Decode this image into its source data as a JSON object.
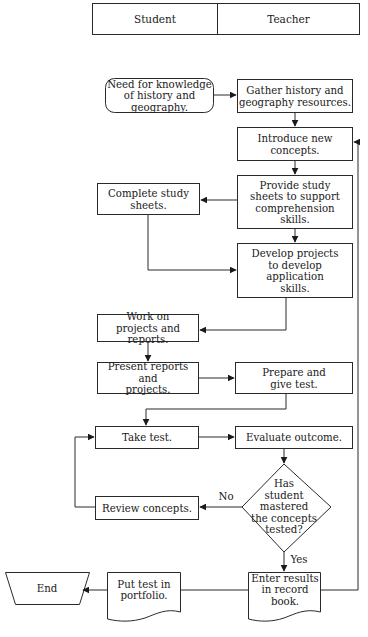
{
  "swimlanes": {
    "student": "Student",
    "teacher": "Teacher"
  },
  "nodes": {
    "start": {
      "label": "Need for knowledge\nof history and geography.",
      "shape": "rounded-rect",
      "lane": "Student"
    },
    "gather": {
      "label": "Gather history and\ngeography resources.",
      "shape": "rect",
      "lane": "Teacher"
    },
    "introduce": {
      "label": "Introduce new\nconcepts.",
      "shape": "rect",
      "lane": "Teacher"
    },
    "provide": {
      "label": "Provide study\nsheets to support\ncomprehension\nskills.",
      "shape": "rect",
      "lane": "Teacher"
    },
    "complete": {
      "label": "Complete study\nsheets.",
      "shape": "rect",
      "lane": "Student"
    },
    "develop": {
      "label": "Develop projects\nto develop\napplication\nskills.",
      "shape": "rect",
      "lane": "Teacher"
    },
    "work": {
      "label": "Work on\nprojects and reports.",
      "shape": "rect",
      "lane": "Student"
    },
    "present": {
      "label": "Present reports and\nprojects.",
      "shape": "rect",
      "lane": "Student"
    },
    "prepare": {
      "label": "Prepare and\ngive test.",
      "shape": "rect",
      "lane": "Teacher"
    },
    "take": {
      "label": "Take test.",
      "shape": "rect",
      "lane": "Student"
    },
    "evaluate": {
      "label": "Evaluate outcome.",
      "shape": "rect",
      "lane": "Teacher"
    },
    "decision": {
      "label": "Has\nstudent\nmastered\nthe concepts\ntested?",
      "shape": "diamond",
      "lane": "Teacher"
    },
    "review": {
      "label": "Review concepts.",
      "shape": "rect",
      "lane": "Student"
    },
    "enter": {
      "label": "Enter results\nin record book.",
      "shape": "document",
      "lane": "Teacher"
    },
    "put": {
      "label": "Put test in\nportfolio.",
      "shape": "document",
      "lane": "Student"
    },
    "end": {
      "label": "End",
      "shape": "trapezoid",
      "lane": "Student"
    }
  },
  "edge_labels": {
    "no": "No",
    "yes": "Yes"
  },
  "edges": [
    [
      "start",
      "gather"
    ],
    [
      "gather",
      "introduce"
    ],
    [
      "introduce",
      "provide"
    ],
    [
      "provide",
      "complete"
    ],
    [
      "provide",
      "develop"
    ],
    [
      "complete",
      "develop"
    ],
    [
      "develop",
      "work"
    ],
    [
      "work",
      "present"
    ],
    [
      "present",
      "prepare"
    ],
    [
      "prepare",
      "take"
    ],
    [
      "take",
      "evaluate"
    ],
    [
      "evaluate",
      "decision"
    ],
    [
      "decision",
      "review",
      "No"
    ],
    [
      "review",
      "take"
    ],
    [
      "decision",
      "enter",
      "Yes"
    ],
    [
      "enter",
      "put"
    ],
    [
      "put",
      "end"
    ],
    [
      "enter",
      "introduce"
    ]
  ],
  "colors": {
    "stroke": "#2a2a2a",
    "background": "#ffffff",
    "text": "#1a1a1a"
  }
}
